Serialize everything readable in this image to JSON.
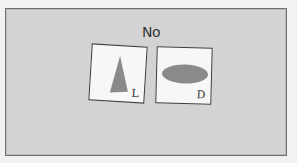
{
  "prompt": {
    "text": "No"
  },
  "cards": [
    {
      "position": "left",
      "shape": "triangle",
      "shape_color": "#8a8a8a",
      "key_label": "L"
    },
    {
      "position": "right",
      "shape": "ellipse",
      "shape_color": "#8a8a8a",
      "key_label": "D"
    }
  ],
  "colors": {
    "background": "#d3d3d3",
    "frame_border": "#6e6e6e",
    "card_fill": "#f7f7f7",
    "shape_fill": "#8a8a8a"
  }
}
